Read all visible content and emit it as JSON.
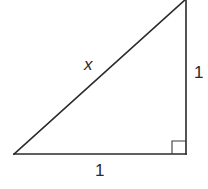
{
  "figure": {
    "type": "right-triangle",
    "vertices": {
      "bottom_left": {
        "x": 14,
        "y": 154
      },
      "bottom_right": {
        "x": 186,
        "y": 154
      },
      "top_right": {
        "x": 186,
        "y": 0
      }
    },
    "right_angle_at": "bottom_right",
    "right_angle_marker_size": 14,
    "colors": {
      "stroke": "#2a2a2a",
      "background": "#ffffff"
    }
  },
  "labels": {
    "hypotenuse": "x",
    "vertical_leg": "1",
    "horizontal_leg": "1"
  }
}
